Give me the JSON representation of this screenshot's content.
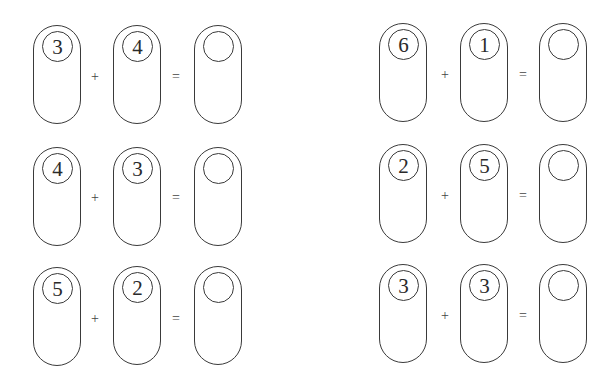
{
  "worksheet": {
    "colors": {
      "stroke": "#3a3a3a",
      "text": "#2a2a2a",
      "background": "#ffffff"
    },
    "plus_symbol": "+",
    "equals_symbol": "=",
    "problems": [
      {
        "a": "3",
        "b": "4",
        "answer": ""
      },
      {
        "a": "6",
        "b": "1",
        "answer": ""
      },
      {
        "a": "4",
        "b": "3",
        "answer": ""
      },
      {
        "a": "2",
        "b": "5",
        "answer": ""
      },
      {
        "a": "5",
        "b": "2",
        "answer": ""
      },
      {
        "a": "3",
        "b": "3",
        "answer": ""
      }
    ]
  }
}
